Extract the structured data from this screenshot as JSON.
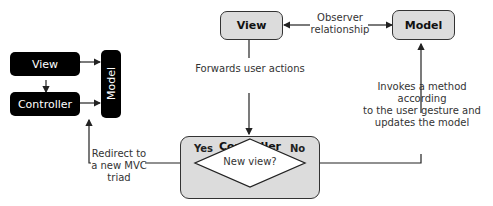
{
  "mini_triad": {
    "view": "View",
    "controller": "Controller",
    "model": "Model"
  },
  "main": {
    "view": "View",
    "model": "Model",
    "controller": "Controller",
    "decision": "New view?",
    "yes": "Yes",
    "no": "No"
  },
  "annotations": {
    "observer_line1": "Observer",
    "observer_line2": "relationship",
    "forwards": "Forwards user actions",
    "invokes_line1": "Invokes a method according",
    "invokes_line2": "to the user gesture and",
    "invokes_line3": "updates the model",
    "redirect_line1": "Redirect to",
    "redirect_line2": "a new MVC",
    "redirect_line3": "triad"
  }
}
